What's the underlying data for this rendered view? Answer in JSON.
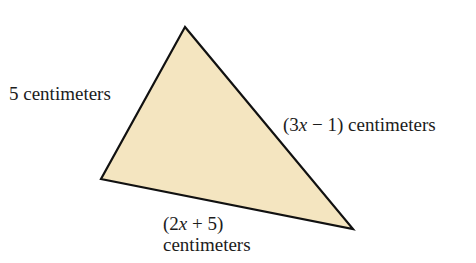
{
  "figure": {
    "type": "triangle",
    "fill_color": "#F4E5C0",
    "stroke_color": "#111111",
    "vertices": {
      "top": [
        185,
        27
      ],
      "left": [
        101,
        179
      ],
      "right": [
        353,
        229
      ]
    }
  },
  "labels": {
    "left_side": "5 centimeters",
    "right_side_expr_open": "(3",
    "right_side_var": "x",
    "right_side_expr_close": " − 1) centimeters",
    "bottom_side_expr_open": "(2",
    "bottom_side_var": "x",
    "bottom_side_expr_close": " + 5)",
    "bottom_side_unit": "centimeters"
  }
}
